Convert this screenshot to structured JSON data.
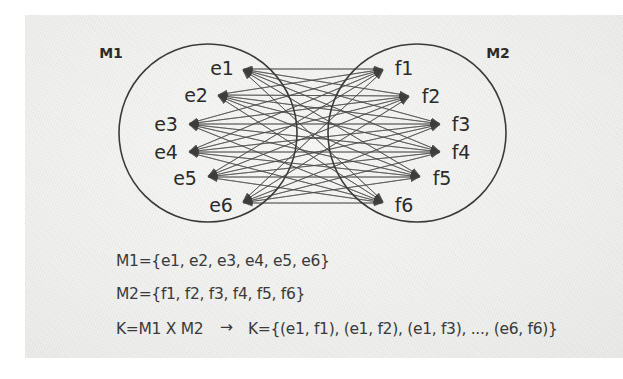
{
  "diagram": {
    "title_type": "cartesian-product-bipartite-graph",
    "left_set": {
      "name": "M1",
      "nodes": [
        "e1",
        "e2",
        "e3",
        "e4",
        "e5",
        "e6"
      ]
    },
    "right_set": {
      "name": "M2",
      "nodes": [
        "f1",
        "f2",
        "f3",
        "f4",
        "f5",
        "f6"
      ]
    },
    "edges_note": "complete bipartite: every e connects to every f (36 edges)",
    "colors": {
      "stroke": "#3b3b3b",
      "edge": "#4a4a4a",
      "text": "#2b2b2b",
      "paper": "#f2f2f1"
    }
  },
  "formulas": {
    "line1": "M1={e1, e2, e3, e4, e5, e6}",
    "line2": "M2={f1, f2, f3, f4, f5, f6}",
    "line3_left": "K=M1 X M2",
    "line3_arrow": "→",
    "line3_right": "K={(e1, f1), (e1, f2), (e1, f3), ..., (e6, f6)}"
  },
  "node_positions": {
    "left": [
      {
        "label": "e1",
        "lx": 222,
        "ly": 68,
        "ax": 241,
        "ay": 69
      },
      {
        "label": "e2",
        "lx": 196,
        "ly": 95,
        "ax": 216,
        "ay": 95
      },
      {
        "label": "e3",
        "lx": 166,
        "ly": 124,
        "ax": 187,
        "ay": 124
      },
      {
        "label": "e4",
        "lx": 166,
        "ly": 152,
        "ax": 187,
        "ay": 152
      },
      {
        "label": "e5",
        "lx": 185,
        "ly": 178,
        "ax": 206,
        "ay": 177
      },
      {
        "label": "e6",
        "lx": 221,
        "ly": 205,
        "ax": 241,
        "ay": 203
      }
    ],
    "right": [
      {
        "label": "f1",
        "lx": 404,
        "ly": 68,
        "ax": 385,
        "ay": 69
      },
      {
        "label": "f2",
        "lx": 431,
        "ly": 96,
        "ax": 411,
        "ay": 96
      },
      {
        "label": "f3",
        "lx": 461,
        "ly": 124,
        "ax": 442,
        "ay": 124
      },
      {
        "label": "f4",
        "lx": 461,
        "ly": 152,
        "ax": 442,
        "ay": 152
      },
      {
        "label": "f5",
        "lx": 442,
        "ly": 178,
        "ax": 422,
        "ay": 177
      },
      {
        "label": "f6",
        "lx": 404,
        "ly": 205,
        "ax": 385,
        "ay": 203
      }
    ]
  },
  "circles": {
    "left": {
      "cx": 208,
      "cy": 133,
      "r": 89
    },
    "right": {
      "cx": 417,
      "cy": 133,
      "r": 89
    }
  },
  "set_label_positions": {
    "left": {
      "x": 111,
      "y": 53
    },
    "right": {
      "x": 498,
      "y": 53
    }
  },
  "formula_positions": {
    "line1": {
      "x": 116,
      "y": 252
    },
    "line2": {
      "x": 116,
      "y": 285
    },
    "line3_left": {
      "x": 116,
      "y": 320
    },
    "line3_arrow": {
      "x": 220,
      "y": 318
    },
    "line3_right": {
      "x": 248,
      "y": 320
    }
  }
}
